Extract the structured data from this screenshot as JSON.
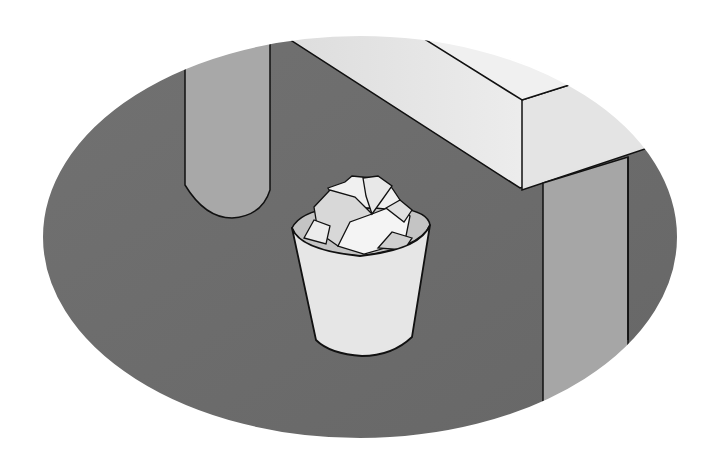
{
  "illustration": {
    "title": "Trash bin with crumpled paper under a desk",
    "subject": "wastebasket",
    "contents": "crumpled paper",
    "colors": {
      "background": "#ffffff",
      "floor": "#6a6a6a",
      "desk_leg": "#a8a8a8",
      "desk_top": "#ececec",
      "desk_front": "#e2e2e2",
      "bin": "#e6e6e6",
      "bin_inner": "#c4c4c4",
      "paper": "#f2f2f2",
      "paper_shade": "#d6d6d6",
      "outline": "#111111"
    }
  }
}
